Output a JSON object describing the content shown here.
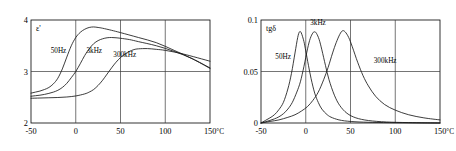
{
  "figure": {
    "background_color": "#ffffff",
    "line_color": "#1a1a1a",
    "grid_color": "#3a3a3a"
  },
  "chart_data": [
    {
      "type": "line",
      "title": "",
      "panel": "left",
      "ylabel": "ε'",
      "xlabel": "",
      "xunit": "°C",
      "xlim": [
        -50,
        150
      ],
      "ylim": [
        2,
        4
      ],
      "xticks": [
        -50,
        0,
        50,
        100,
        150
      ],
      "xticklabels": [
        "-50",
        "0",
        "50",
        "100",
        "150"
      ],
      "yticks": [
        2,
        3,
        4
      ],
      "yticklabels": [
        "2",
        "3",
        "4"
      ],
      "grid": true,
      "gridlines_x": [
        0,
        50,
        100
      ],
      "gridlines_y": [
        3
      ],
      "legend_position": "inline-annotations",
      "series": [
        {
          "name": "50Hz",
          "label": "50Hz",
          "label_x": -28,
          "label_y": 3.35,
          "x": [
            -50,
            -45,
            -40,
            -35,
            -30,
            -25,
            -20,
            -15,
            -10,
            -5,
            0,
            5,
            10,
            15,
            20,
            25,
            30,
            40,
            50,
            70,
            90,
            110,
            130,
            150
          ],
          "values": [
            2.58,
            2.6,
            2.62,
            2.65,
            2.69,
            2.76,
            2.87,
            3.05,
            3.28,
            3.5,
            3.66,
            3.76,
            3.82,
            3.855,
            3.865,
            3.855,
            3.84,
            3.8,
            3.755,
            3.66,
            3.56,
            3.41,
            3.25,
            3.06
          ]
        },
        {
          "name": "3kHz",
          "label": "3kHz",
          "label_x": 12,
          "label_y": 3.35,
          "x": [
            -50,
            -45,
            -40,
            -35,
            -30,
            -25,
            -20,
            -15,
            -10,
            -5,
            0,
            5,
            10,
            15,
            20,
            25,
            30,
            35,
            40,
            45,
            50,
            60,
            70,
            90,
            110,
            130,
            150
          ],
          "values": [
            2.52,
            2.53,
            2.54,
            2.555,
            2.575,
            2.6,
            2.635,
            2.69,
            2.77,
            2.88,
            3.0,
            3.15,
            3.31,
            3.44,
            3.54,
            3.6,
            3.635,
            3.655,
            3.66,
            3.655,
            3.645,
            3.62,
            3.58,
            3.5,
            3.39,
            3.25,
            3.07
          ]
        },
        {
          "name": "300kHz",
          "label": "300kHz",
          "label_x": 42,
          "label_y": 3.29,
          "x": [
            -50,
            -40,
            -30,
            -20,
            -10,
            0,
            10,
            15,
            20,
            25,
            30,
            35,
            40,
            45,
            50,
            55,
            60,
            65,
            70,
            80,
            90,
            100,
            120,
            150
          ],
          "values": [
            2.48,
            2.485,
            2.49,
            2.495,
            2.505,
            2.525,
            2.565,
            2.6,
            2.65,
            2.73,
            2.83,
            2.95,
            3.07,
            3.18,
            3.27,
            3.34,
            3.39,
            3.425,
            3.44,
            3.445,
            3.43,
            3.41,
            3.34,
            3.2
          ]
        }
      ]
    },
    {
      "type": "line",
      "title": "",
      "panel": "right",
      "ylabel": "tgδ",
      "xlabel": "",
      "xunit": "°C",
      "xlim": [
        -50,
        150
      ],
      "ylim": [
        0,
        0.1
      ],
      "xticks": [
        -50,
        0,
        50,
        100,
        150
      ],
      "xticklabels": [
        "-50",
        "0",
        "50",
        "100",
        "150"
      ],
      "yticks": [
        0,
        0.05,
        0.1
      ],
      "yticklabels": [
        "0",
        "0.05",
        "0.1"
      ],
      "grid": true,
      "gridlines_x": [
        0,
        50,
        100
      ],
      "gridlines_y": [
        0.05
      ],
      "legend_position": "inline-annotations",
      "series": [
        {
          "name": "50Hz",
          "label": "50Hz",
          "label_x": -34,
          "label_y": 0.062,
          "x": [
            -50,
            -45,
            -40,
            -35,
            -30,
            -25,
            -20,
            -16,
            -12,
            -9,
            -7,
            -5,
            -2,
            0,
            3,
            6,
            10,
            14,
            18,
            24,
            30,
            40,
            55,
            75,
            100,
            130,
            150
          ],
          "values": [
            0.0,
            0.0025,
            0.005,
            0.008,
            0.013,
            0.02,
            0.033,
            0.048,
            0.068,
            0.083,
            0.0885,
            0.0875,
            0.079,
            0.07,
            0.056,
            0.043,
            0.029,
            0.02,
            0.0135,
            0.008,
            0.005,
            0.0025,
            0.0012,
            0.0006,
            0.0003,
            0.0001,
            0.0
          ]
        },
        {
          "name": "3kHz",
          "label": "3kHz",
          "label_x": 5,
          "label_y": 0.0955,
          "x": [
            -50,
            -45,
            -40,
            -35,
            -30,
            -25,
            -20,
            -15,
            -10,
            -6,
            -2,
            2,
            5,
            8,
            10,
            12,
            15,
            18,
            22,
            26,
            32,
            38,
            46,
            56,
            70,
            90,
            115,
            150
          ],
          "values": [
            0.0,
            0.0012,
            0.0025,
            0.004,
            0.006,
            0.009,
            0.0135,
            0.02,
            0.03,
            0.04,
            0.055,
            0.072,
            0.082,
            0.0875,
            0.0885,
            0.087,
            0.081,
            0.071,
            0.056,
            0.042,
            0.027,
            0.017,
            0.0095,
            0.005,
            0.0024,
            0.001,
            0.0004,
            0.0
          ]
        },
        {
          "name": "300kHz",
          "label": "300kHz",
          "label_x": 76,
          "label_y": 0.058,
          "x": [
            -50,
            -40,
            -30,
            -20,
            -12,
            -5,
            2,
            8,
            14,
            20,
            25,
            30,
            34,
            38,
            41,
            44,
            48,
            52,
            58,
            64,
            70,
            78,
            88,
            100,
            115,
            132,
            150
          ],
          "values": [
            0.0,
            0.0015,
            0.003,
            0.0055,
            0.008,
            0.0115,
            0.016,
            0.022,
            0.03,
            0.042,
            0.054,
            0.068,
            0.078,
            0.086,
            0.0895,
            0.0885,
            0.083,
            0.074,
            0.059,
            0.046,
            0.036,
            0.026,
            0.018,
            0.0125,
            0.008,
            0.005,
            0.003
          ]
        }
      ]
    }
  ]
}
